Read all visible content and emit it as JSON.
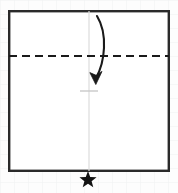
{
  "figure": {
    "background_color": "#fdfdfd",
    "grid_paper": {
      "visible": true,
      "line_color": "#f0f1f2",
      "cell_size": 14
    },
    "ink_color": "#1a1a1a",
    "guide_color": "#d8d8d8"
  },
  "paper_sheet": {
    "shape": "square",
    "x": 8,
    "y": 10,
    "width": 162,
    "height": 162,
    "stroke_color": "#2a2a2a",
    "stroke_width": 2.4,
    "fill_color": "#ffffff"
  },
  "fold_line": {
    "kind": "valley-fold",
    "orientation": "horizontal",
    "y": 56,
    "x_start": 9,
    "x_end": 169,
    "style": "dashed",
    "dash_length": 8,
    "gap_length": 5,
    "stroke_color": "#1a1a1a",
    "stroke_width": 2.2
  },
  "center_guide": {
    "orientation": "vertical",
    "x": 89,
    "y_start": 11,
    "y_end": 171,
    "stroke_color": "#dcdcdc",
    "stroke_width": 1.2
  },
  "center_tick": {
    "orientation": "horizontal",
    "x_start": 80,
    "x_end": 98,
    "y": 91,
    "stroke_color": "#c9c9c9",
    "stroke_width": 1.4
  },
  "fold_arrow": {
    "kind": "curved-fold-arrow",
    "direction": "downward",
    "start_x": 97,
    "start_y": 16,
    "end_x": 96,
    "end_y": 79,
    "control1_x": 108,
    "control1_y": 34,
    "control2_x": 105,
    "control2_y": 62,
    "stroke_color": "#1a1a1a",
    "stroke_width": 2.1,
    "head_length": 11,
    "head_width": 9
  },
  "star_marker": {
    "shape": "five-pointed-star",
    "center_x": 88,
    "center_y": 180,
    "outer_radius": 9,
    "inner_radius": 3.8,
    "fill_color": "#131313",
    "label": "step-marker-star"
  }
}
